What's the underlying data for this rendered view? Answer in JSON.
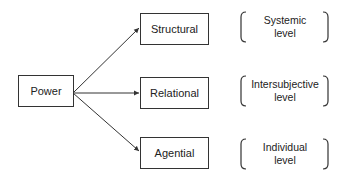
{
  "diagram": {
    "root": {
      "label": "Power"
    },
    "branches": [
      {
        "label": "Structural",
        "level_line1": "Systemic",
        "level_line2": "level"
      },
      {
        "label": "Relational",
        "level_line1": "Intersubjective",
        "level_line2": "level"
      },
      {
        "label": "Agential",
        "level_line1": "Individual",
        "level_line2": "level"
      }
    ],
    "colors": {
      "stroke": "#333333",
      "background": "#ffffff"
    }
  }
}
